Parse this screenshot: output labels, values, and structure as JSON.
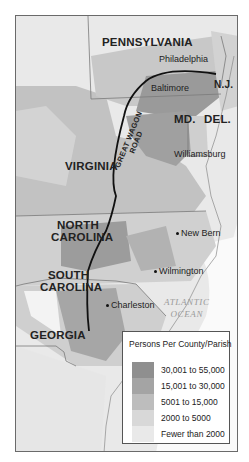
{
  "map": {
    "states": {
      "pennsylvania": "PENNSYLVANIA",
      "nj": "N.J.",
      "md": "MD.",
      "del": "DEL.",
      "virginia": "VIRGINIA",
      "north_carolina_1": "NORTH",
      "north_carolina_2": "CAROLINA",
      "south_carolina_1": "SOUTH",
      "south_carolina_2": "CAROLINA",
      "georgia": "GEORGIA"
    },
    "cities": {
      "philadelphia": "Philadelphia",
      "baltimore": "Baltimore",
      "williamsburg": "Williamsburg",
      "new_bern": "New Bern",
      "wilmington": "Wilmington",
      "charleston": "Charleston"
    },
    "road": {
      "line1": "GREAT WAGON",
      "line2": "ROAD"
    },
    "ocean": {
      "line1": "ATLANTIC",
      "line2": "OCEAN"
    }
  },
  "legend": {
    "title": "Persons Per County/Parish",
    "items": [
      {
        "label": "30,001 to 55,000",
        "color": "#8f8f8f"
      },
      {
        "label": "15,001 to 30,000",
        "color": "#a4a4a4"
      },
      {
        "label": "5001 to 15,000",
        "color": "#bdbdbd"
      },
      {
        "label": "2000 to 5000",
        "color": "#d8d8d8"
      },
      {
        "label": "Fewer than 2000",
        "color": "#e9e9e9"
      }
    ]
  }
}
